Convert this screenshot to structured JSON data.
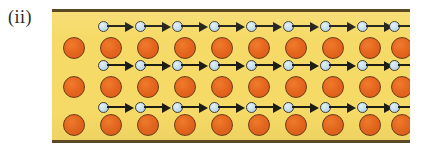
{
  "figure": {
    "label": "(ii)",
    "caption": "",
    "panel": {
      "background_color": "#f6da67",
      "border_color": "#5b4a25"
    }
  },
  "legend": {
    "ion_name": "orange-ion-circle",
    "ion_color": "#e5661e",
    "ion_outline_color": "#6b3b14",
    "bead_name": "light-blue-circle",
    "bead_color": "#c2dced",
    "bead_outline_color": "#3b3b33",
    "arrow_name": "right-arrow",
    "arrow_color": "#1d1d14",
    "arrow_direction": "right"
  },
  "lattice": {
    "rows": [
      {
        "id": "row-top",
        "name": "top-row",
        "ion_count": 10,
        "arrow_position": "above",
        "sites": [
          {
            "x": 22,
            "ion": true,
            "arrow_above": false,
            "arrow_below": false
          },
          {
            "x": 59,
            "ion": true,
            "arrow_above": true,
            "arrow_below": false
          },
          {
            "x": 96,
            "ion": true,
            "arrow_above": true,
            "arrow_below": false
          },
          {
            "x": 133,
            "ion": true,
            "arrow_above": true,
            "arrow_below": false
          },
          {
            "x": 170,
            "ion": true,
            "arrow_above": true,
            "arrow_below": false
          },
          {
            "x": 207,
            "ion": true,
            "arrow_above": true,
            "arrow_below": false
          },
          {
            "x": 244,
            "ion": true,
            "arrow_above": true,
            "arrow_below": false
          },
          {
            "x": 281,
            "ion": true,
            "arrow_above": true,
            "arrow_below": false
          },
          {
            "x": 318,
            "ion": true,
            "arrow_above": true,
            "arrow_below": false
          },
          {
            "x": 350,
            "ion": true,
            "arrow_above": true,
            "arrow_below": false
          }
        ]
      },
      {
        "id": "row-middle",
        "name": "middle-row",
        "ion_count": 10,
        "arrow_position": "above-and-below",
        "sites": [
          {
            "x": 22,
            "ion": true,
            "arrow_above": false,
            "arrow_below": false
          },
          {
            "x": 59,
            "ion": true,
            "arrow_above": true,
            "arrow_below": true
          },
          {
            "x": 96,
            "ion": true,
            "arrow_above": true,
            "arrow_below": true
          },
          {
            "x": 133,
            "ion": true,
            "arrow_above": true,
            "arrow_below": true
          },
          {
            "x": 170,
            "ion": true,
            "arrow_above": true,
            "arrow_below": true
          },
          {
            "x": 207,
            "ion": true,
            "arrow_above": true,
            "arrow_below": true
          },
          {
            "x": 244,
            "ion": true,
            "arrow_above": true,
            "arrow_below": true
          },
          {
            "x": 281,
            "ion": true,
            "arrow_above": true,
            "arrow_below": true
          },
          {
            "x": 318,
            "ion": true,
            "arrow_above": true,
            "arrow_below": true
          },
          {
            "x": 350,
            "ion": true,
            "arrow_above": true,
            "arrow_below": true
          }
        ]
      },
      {
        "id": "row-bottom",
        "name": "bottom-row",
        "ion_count": 10,
        "arrow_position": "below",
        "sites": [
          {
            "x": 22,
            "ion": true,
            "arrow_above": false,
            "arrow_below": false
          },
          {
            "x": 59,
            "ion": true,
            "arrow_above": false,
            "arrow_below": true
          },
          {
            "x": 96,
            "ion": true,
            "arrow_above": false,
            "arrow_below": true
          },
          {
            "x": 133,
            "ion": true,
            "arrow_above": false,
            "arrow_below": true
          },
          {
            "x": 170,
            "ion": true,
            "arrow_above": false,
            "arrow_below": true
          },
          {
            "x": 207,
            "ion": true,
            "arrow_above": false,
            "arrow_below": true
          },
          {
            "x": 244,
            "ion": true,
            "arrow_above": false,
            "arrow_below": true
          },
          {
            "x": 281,
            "ion": true,
            "arrow_above": false,
            "arrow_below": true
          },
          {
            "x": 318,
            "ion": true,
            "arrow_above": false,
            "arrow_below": true
          },
          {
            "x": 350,
            "ion": true,
            "arrow_above": false,
            "arrow_below": true
          }
        ]
      }
    ]
  }
}
